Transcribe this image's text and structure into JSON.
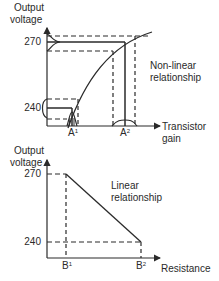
{
  "top_graph": {
    "y_label_line1": "Output",
    "y_label_line2": "voltage",
    "y_ticks": [
      "270",
      "240"
    ],
    "x_markers": [
      {
        "base": "A",
        "sup": "1"
      },
      {
        "base": "A",
        "sup": "2"
      }
    ],
    "x_label_line1": "Transistor",
    "x_label_line2": "gain",
    "annotation_line1": "Non-linear",
    "annotation_line2": "relationship"
  },
  "bottom_graph": {
    "y_label_line1": "Output",
    "y_label_line2": "voltage",
    "y_ticks": [
      "270",
      "240"
    ],
    "x_markers": [
      {
        "base": "B",
        "sup": "1"
      },
      {
        "base": "B",
        "sup": "2"
      }
    ],
    "x_label": "Resistance",
    "annotation_line1": "Linear",
    "annotation_line2": "relationship"
  },
  "colors": {
    "line": "#2a2a2a",
    "background": "#ffffff"
  }
}
